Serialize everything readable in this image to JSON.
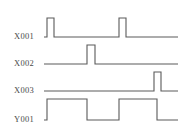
{
  "diagram": {
    "type": "timing-diagram",
    "background_color": "#ffffff",
    "line_color": "#5a5a5a",
    "label_color": "#4a4a4a",
    "width": 189,
    "height": 137
  },
  "signals": [
    {
      "name": "X001",
      "label": "X001",
      "row": 0,
      "baseline_y": 37,
      "high_y": 18,
      "label_x": 14,
      "label_y": 37,
      "wave_start_x": 44,
      "wave_end_x": 178,
      "pulses": [
        {
          "rise_x": 47,
          "fall_x": 54
        },
        {
          "rise_x": 119,
          "fall_x": 126
        }
      ]
    },
    {
      "name": "X002",
      "label": "X002",
      "row": 1,
      "baseline_y": 64,
      "high_y": 45,
      "label_x": 14,
      "label_y": 64,
      "wave_start_x": 44,
      "wave_end_x": 178,
      "pulses": [
        {
          "rise_x": 87,
          "fall_x": 95
        }
      ]
    },
    {
      "name": "X003",
      "label": "X003",
      "row": 2,
      "baseline_y": 91,
      "high_y": 72,
      "label_x": 14,
      "label_y": 91,
      "wave_start_x": 44,
      "wave_end_x": 178,
      "pulses": [
        {
          "rise_x": 154,
          "fall_x": 161
        }
      ]
    },
    {
      "name": "Y001",
      "label": "Y001",
      "row": 3,
      "baseline_y": 120,
      "high_y": 99,
      "label_x": 14,
      "label_y": 120,
      "wave_start_x": 44,
      "wave_end_x": 178,
      "pulses": [
        {
          "rise_x": 47,
          "fall_x": 87
        },
        {
          "rise_x": 119,
          "fall_x": 157
        }
      ]
    }
  ]
}
